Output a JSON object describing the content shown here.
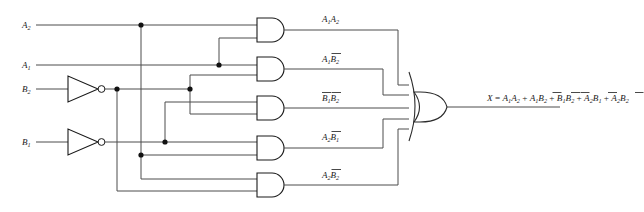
{
  "diagram": {
    "type": "logic-circuit-schematic",
    "colors": {
      "wire": "#4c4c4c",
      "gate_outline": "#1a1a1a",
      "background": "#ffffff",
      "junction_dot": "#111111"
    }
  },
  "inputs": [
    {
      "id": "A2",
      "base": "A",
      "sub": "2",
      "label": "A2",
      "y": 25
    },
    {
      "id": "A1",
      "base": "A",
      "sub": "1",
      "label": "A1",
      "y": 65
    },
    {
      "id": "B2",
      "base": "B",
      "sub": "2",
      "label": "B2",
      "y": 89
    },
    {
      "id": "B1",
      "base": "B",
      "sub": "1",
      "label": "B1",
      "y": 142
    }
  ],
  "inverters": [
    {
      "id": "inv-B2",
      "input": "B2",
      "output": "B2-bar",
      "y": 89
    },
    {
      "id": "inv-B1",
      "input": "B1",
      "output": "B1-bar",
      "y": 142
    }
  ],
  "and_gates": [
    {
      "id": "and-1",
      "label_base": "A1A2",
      "terms": [
        "A1",
        "A2"
      ],
      "y": 30,
      "product_label": "A1A2"
    },
    {
      "id": "and-2",
      "label_base": "A1B2b",
      "terms": [
        "A1",
        "B2-bar"
      ],
      "y": 69,
      "product_label": "A1B2"
    },
    {
      "id": "and-3",
      "label_base": "B1bB2b",
      "terms": [
        "B1-bar",
        "B2-bar"
      ],
      "y": 108,
      "product_label": "B1B2"
    },
    {
      "id": "and-4",
      "label_base": "A2B1b",
      "terms": [
        "A2",
        "B1-bar"
      ],
      "y": 148,
      "product_label": "A2B1"
    },
    {
      "id": "and-5",
      "label_base": "A2B2b",
      "terms": [
        "A2",
        "B2-bar"
      ],
      "y": 185,
      "product_label": "A2B2"
    }
  ],
  "product_labels": [
    {
      "id": "p1",
      "t1": "A",
      "s1": "1",
      "t2": "A",
      "s2": "2",
      "bar1": false,
      "bar2": false,
      "x": 322,
      "y": 22
    },
    {
      "id": "p2",
      "t1": "A",
      "s1": "1",
      "t2": "B",
      "s2": "2",
      "bar1": false,
      "bar2": true,
      "x": 322,
      "y": 62
    },
    {
      "id": "p3",
      "t1": "B",
      "s1": "1",
      "t2": "B",
      "s2": "2",
      "bar1": true,
      "bar2": true,
      "x": 322,
      "y": 101
    },
    {
      "id": "p4",
      "t1": "A",
      "s1": "2",
      "t2": "B",
      "s2": "1",
      "bar1": false,
      "bar2": true,
      "x": 322,
      "y": 140
    },
    {
      "id": "p5",
      "t1": "A",
      "s1": "2",
      "t2": "B",
      "s2": "2",
      "bar1": false,
      "bar2": true,
      "x": 322,
      "y": 178
    }
  ],
  "or_gate": {
    "id": "or-1",
    "inputs": 5,
    "y": 106
  },
  "output": {
    "name": "X",
    "equation_text": "X = A1A2 + A1B2 + B1B2 + A2B1 + A2B2",
    "equation_terms": [
      {
        "t1": "A",
        "s1": "1",
        "bar1": false,
        "t2": "A",
        "s2": "2",
        "bar2": false
      },
      {
        "t1": "A",
        "s1": "1",
        "bar1": false,
        "t2": "B",
        "s2": "2",
        "bar2": true
      },
      {
        "t1": "B",
        "s1": "1",
        "bar1": true,
        "t2": "B",
        "s2": "2",
        "bar2": true
      },
      {
        "t1": "A",
        "s1": "2",
        "bar1": false,
        "t2": "B",
        "s2": "1",
        "bar2": true
      },
      {
        "t1": "A",
        "s1": "2",
        "bar1": false,
        "t2": "B",
        "s2": "2",
        "bar2": true
      }
    ],
    "x": 487,
    "y": 101
  }
}
